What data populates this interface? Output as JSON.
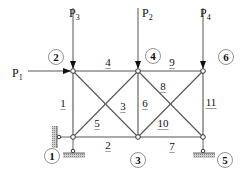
{
  "diagram": {
    "type": "plane-truss",
    "colors": {
      "member": "#555555",
      "node_fill": "#ffffff",
      "node_stroke": "#333333",
      "text": "#111111",
      "hatch": "#999999"
    },
    "nodes": [
      {
        "id": "1",
        "label": "1",
        "x": 73,
        "y": 137,
        "label_x": 52,
        "label_y": 156
      },
      {
        "id": "2",
        "label": "2",
        "x": 73,
        "y": 71,
        "label_x": 56,
        "label_y": 57
      },
      {
        "id": "3",
        "label": "3",
        "x": 138,
        "y": 137,
        "label_x": 138,
        "label_y": 160
      },
      {
        "id": "4",
        "label": "4",
        "x": 138,
        "y": 71,
        "label_x": 153,
        "label_y": 56
      },
      {
        "id": "5",
        "label": "5",
        "x": 203,
        "y": 137,
        "label_x": 225,
        "label_y": 160
      },
      {
        "id": "6",
        "label": "6",
        "x": 203,
        "y": 71,
        "label_x": 226,
        "label_y": 57
      }
    ],
    "members": [
      {
        "id": "1",
        "label": "1",
        "from": "1",
        "to": "2",
        "label_x": 63,
        "label_y": 107
      },
      {
        "id": "2",
        "label": "2",
        "from": "1",
        "to": "3",
        "label_x": 108,
        "label_y": 149
      },
      {
        "id": "3",
        "label": "3",
        "from": "2",
        "to": "3",
        "label_x": 123,
        "label_y": 110
      },
      {
        "id": "4",
        "label": "4",
        "from": "2",
        "to": "4",
        "label_x": 108,
        "label_y": 66
      },
      {
        "id": "5",
        "label": "5",
        "from": "1",
        "to": "4",
        "label_x": 97,
        "label_y": 127
      },
      {
        "id": "6",
        "label": "6",
        "from": "3",
        "to": "4",
        "label_x": 145,
        "label_y": 107
      },
      {
        "id": "7",
        "label": "7",
        "from": "3",
        "to": "5",
        "label_x": 172,
        "label_y": 150
      },
      {
        "id": "8",
        "label": "8",
        "from": "4",
        "to": "5",
        "label_x": 163,
        "label_y": 90
      },
      {
        "id": "9",
        "label": "9",
        "from": "4",
        "to": "6",
        "label_x": 172,
        "label_y": 66
      },
      {
        "id": "10",
        "label": "10",
        "from": "3",
        "to": "6",
        "label_x": 163,
        "label_y": 127
      },
      {
        "id": "11",
        "label": "11",
        "from": "5",
        "to": "6",
        "label_x": 211,
        "label_y": 106
      }
    ],
    "loads": [
      {
        "id": "P1",
        "base": "P",
        "sub": "1",
        "node": "2",
        "direction": "right",
        "label_x": 12,
        "label_y": 77
      },
      {
        "id": "P2",
        "base": "P",
        "sub": "2",
        "node": "4",
        "direction": "down",
        "label_x": 142,
        "label_y": 17
      },
      {
        "id": "P3",
        "base": "P",
        "sub": "3",
        "node": "2",
        "direction": "down",
        "label_x": 69,
        "label_y": 17
      },
      {
        "id": "P4",
        "base": "P",
        "sub": "4",
        "node": "6",
        "direction": "down",
        "label_x": 200,
        "label_y": 17
      }
    ],
    "supports": [
      {
        "node": "1",
        "type": "pin",
        "restraints": [
          "horizontal",
          "vertical"
        ]
      },
      {
        "node": "5",
        "type": "roller",
        "restraints": [
          "vertical"
        ]
      }
    ]
  }
}
